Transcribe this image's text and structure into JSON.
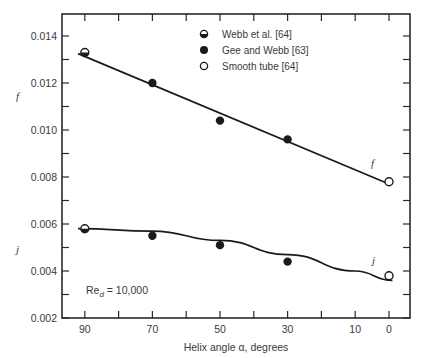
{
  "chart_data": {
    "type": "scatter",
    "title": "",
    "xlabel": "Helix angle α, degrees",
    "ylabel_top": "f",
    "ylabel_bottom": "j",
    "x_reversed": true,
    "xlim": [
      96,
      -6
    ],
    "ylim": [
      0.002,
      0.015
    ],
    "x_ticks": [
      90,
      70,
      50,
      30,
      10,
      0
    ],
    "x_minor_ticks": [
      90,
      80,
      70,
      60,
      50,
      40,
      30,
      20,
      10,
      0
    ],
    "y_ticks": [
      "0.014",
      "0.012",
      "0.010",
      "0.008",
      "0.006",
      "0.004",
      "0.002"
    ],
    "y_tick_values": [
      0.014,
      0.012,
      0.01,
      0.008,
      0.006,
      0.004,
      0.002
    ],
    "grid": false,
    "legend_position": "top-center",
    "legend": [
      {
        "label": "Webb et al. [64]",
        "marker": "half-filled-circle"
      },
      {
        "label": "Gee and Webb [63]",
        "marker": "filled-circle"
      },
      {
        "label": "Smooth tube [64]",
        "marker": "open-circle"
      }
    ],
    "series": [
      {
        "name": "Webb et al. [64]",
        "quantity": "f",
        "marker": "half-filled-circle",
        "x": [
          90
        ],
        "y": [
          0.0133
        ]
      },
      {
        "name": "Webb et al. [64]",
        "quantity": "j",
        "marker": "half-filled-circle",
        "x": [
          90
        ],
        "y": [
          0.0058
        ]
      },
      {
        "name": "Gee and Webb [63]",
        "quantity": "f",
        "marker": "filled-circle",
        "x": [
          70,
          50,
          30
        ],
        "y": [
          0.012,
          0.0104,
          0.0096
        ]
      },
      {
        "name": "Gee and Webb [63]",
        "quantity": "j",
        "marker": "filled-circle",
        "x": [
          70,
          50,
          30
        ],
        "y": [
          0.0055,
          0.0051,
          0.0044
        ]
      },
      {
        "name": "Smooth tube [64]",
        "quantity": "f",
        "marker": "open-circle",
        "x": [
          0
        ],
        "y": [
          0.0078
        ]
      },
      {
        "name": "Smooth tube [64]",
        "quantity": "j",
        "marker": "open-circle",
        "x": [
          0
        ],
        "y": [
          0.0038
        ]
      }
    ],
    "fit_curves": [
      {
        "name": "f",
        "label": "f",
        "shape": "straight",
        "x": [
          92,
          0
        ],
        "y": [
          0.01325,
          0.0077
        ]
      },
      {
        "name": "j",
        "label": "j",
        "shape": "curved",
        "x": [
          92,
          70,
          50,
          30,
          10,
          -1
        ],
        "y": [
          0.0058,
          0.0057,
          0.0053,
          0.0047,
          0.004,
          0.0036
        ]
      }
    ],
    "annotations": [
      {
        "text": "Re_d = 10,000",
        "display_main": "Re",
        "display_sub": "d",
        "display_rest": " = 10,000"
      }
    ]
  }
}
